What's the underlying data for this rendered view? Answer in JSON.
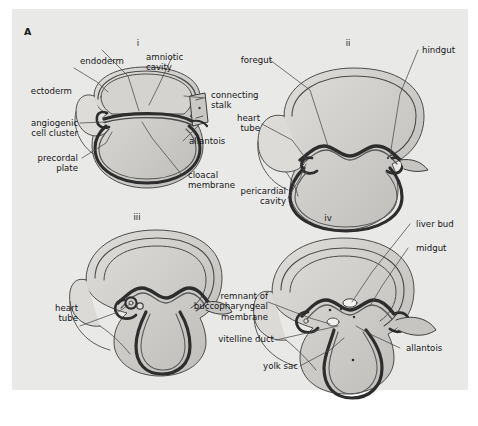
{
  "figure": {
    "panel_letter": "A",
    "background_color": "#e9e9e7",
    "line_color": "#3c3c3c",
    "fill_light": "#e0e0dd",
    "fill_mid": "#cccbc8",
    "fill_dark": "#b5b4b0"
  },
  "subpanels": [
    {
      "id": "i",
      "numeral": "i"
    },
    {
      "id": "ii",
      "numeral": "ii"
    },
    {
      "id": "iii",
      "numeral": "iii"
    },
    {
      "id": "iv",
      "numeral": "iv"
    }
  ],
  "labels": {
    "i": {
      "endoderm": "endoderm",
      "amniotic_cavity": "amniotic\ncavity",
      "ectoderm": "ectoderm",
      "connecting_stalk": "connecting\nstalk",
      "angiogenic_cell_cluster": "angiogenic\ncell cluster",
      "allantois": "allantois",
      "precordal_plate": "precordal\nplate",
      "cloacal_membrane": "cloacal\nmembrane"
    },
    "ii": {
      "foregut": "foregut",
      "hindgut": "hindgut",
      "heart_tube": "heart\ntube",
      "pericardial_cavity": "pericardial\ncavity"
    },
    "iii": {
      "heart_tube": "heart\ntube"
    },
    "iv": {
      "liver_bud": "liver bud",
      "midgut": "midgut",
      "remnant_of_buccopharyngeal_membrane": "remnant of\nbuccopharyngeal\nmembrane",
      "vitelline_duct": "vitelline duct",
      "yolk_sac": "yolk sac",
      "allantois": "allantois"
    }
  },
  "caption": {
    "text": ""
  }
}
